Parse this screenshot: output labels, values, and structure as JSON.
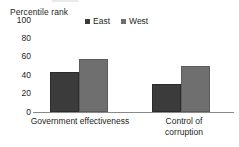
{
  "chart_data": {
    "type": "bar",
    "title": "",
    "subtitle": "",
    "xlabel": "",
    "ylabel": "Percentile rank",
    "ylim": [
      0,
      100
    ],
    "ytick_values": [
      100,
      80,
      60,
      40,
      20,
      0
    ],
    "ytick_labels": [
      "100",
      "80",
      "60",
      "40",
      "20",
      "0"
    ],
    "grid": false,
    "legend_position": "top-center",
    "categories": [
      "Government effectiveness",
      "Control of corruption"
    ],
    "category_label_lines": [
      [
        "Government effectiveness"
      ],
      [
        "Control of",
        "corruption"
      ]
    ],
    "series": [
      {
        "name": "East",
        "color": "#3b3b3b",
        "values": [
          43,
          30
        ]
      },
      {
        "name": "West",
        "color": "#6f6f6f",
        "values": [
          58,
          50
        ]
      }
    ]
  },
  "legend": {
    "items": [
      {
        "label": "East",
        "swatch": "legend-swatch-east"
      },
      {
        "label": "West",
        "swatch": "legend-swatch-west"
      }
    ]
  },
  "axis": {
    "y_title": "Percentile rank",
    "ticks": [
      "100",
      "80",
      "60",
      "40",
      "20",
      "0"
    ]
  },
  "colors": {
    "east": "#3b3b3b",
    "west": "#6f6f6f",
    "axis_line": "#8a8a8a",
    "text": "#231f20",
    "background": "#ffffff"
  }
}
